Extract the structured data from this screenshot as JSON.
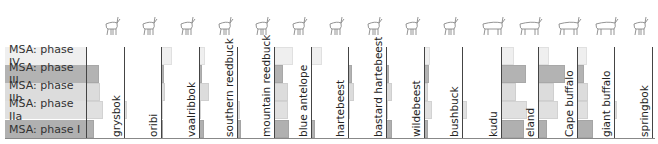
{
  "chart_data": {
    "type": "bar",
    "orientation": "horizontal-small-multiples",
    "title": "",
    "rows": [
      "MSA: phase IV",
      "MSA: phase III",
      "MSA: phase IIb",
      "MSA: phase IIa",
      "MSA: phase I"
    ],
    "row_colors": [
      "#efefef",
      "#b3b3b3",
      "#dcdcdc",
      "#e0e0e0",
      "#b0b0b0"
    ],
    "first_column": {
      "name": "",
      "values": [
        0,
        13,
        14,
        17,
        8
      ]
    },
    "series": [
      {
        "name": "grysbok",
        "icon": "small-antelope-icon",
        "values": [
          0,
          0,
          0,
          3,
          0
        ]
      },
      {
        "name": "oribi",
        "icon": "small-antelope-icon",
        "values": [
          11,
          3,
          4,
          2,
          2
        ]
      },
      {
        "name": "vaalribbok",
        "icon": "small-antelope-icon",
        "values": [
          6,
          3,
          10,
          2,
          5
        ]
      },
      {
        "name": "southern reedbuck",
        "icon": "reedbuck-icon",
        "values": [
          0,
          0,
          0,
          3,
          4
        ]
      },
      {
        "name": "mountain reedbuck",
        "icon": "reedbuck-icon",
        "values": [
          19,
          9,
          14,
          14,
          15
        ]
      },
      {
        "name": "blue antelope",
        "icon": "antelope-icon",
        "values": [
          11,
          0,
          0,
          0,
          4
        ]
      },
      {
        "name": "hartebeest",
        "icon": "hartebeest-icon",
        "values": [
          0,
          4,
          6,
          2,
          0
        ]
      },
      {
        "name": "bastard hartebeest",
        "icon": "hartebeest-icon",
        "values": [
          0,
          3,
          6,
          1,
          6
        ]
      },
      {
        "name": "wildebeest",
        "icon": "wildebeest-icon",
        "values": [
          6,
          5,
          4,
          8,
          4
        ]
      },
      {
        "name": "bushbuck",
        "icon": "bushbuck-icon",
        "values": [
          0,
          0,
          0,
          5,
          0
        ]
      },
      {
        "name": "kudu",
        "icon": "kudu-icon",
        "values": [
          13,
          25,
          15,
          26,
          23
        ]
      },
      {
        "name": "eland",
        "icon": "eland-icon",
        "values": [
          11,
          27,
          16,
          20,
          9
        ]
      },
      {
        "name": "Cape buffalo",
        "icon": "buffalo-icon",
        "values": [
          10,
          7,
          11,
          11,
          16
        ]
      },
      {
        "name": "giant buffalo",
        "icon": "giant-buffalo-icon",
        "values": [
          0,
          0,
          0,
          3,
          0
        ]
      },
      {
        "name": "springbok",
        "icon": "springbok-icon",
        "values": [
          0,
          0,
          0,
          0,
          0
        ]
      }
    ],
    "xlabel": "",
    "ylabel": "",
    "grid": false,
    "legend": "row labels at left"
  },
  "layout": {
    "row_tops": [
      47,
      65,
      83,
      101,
      120
    ],
    "row_height": 18,
    "first_baseline": 86,
    "baselines": [
      124,
      161,
      199,
      237,
      274,
      311,
      348,
      386,
      424,
      462,
      501,
      538,
      577,
      614,
      652
    ],
    "axis_y": 138
  }
}
